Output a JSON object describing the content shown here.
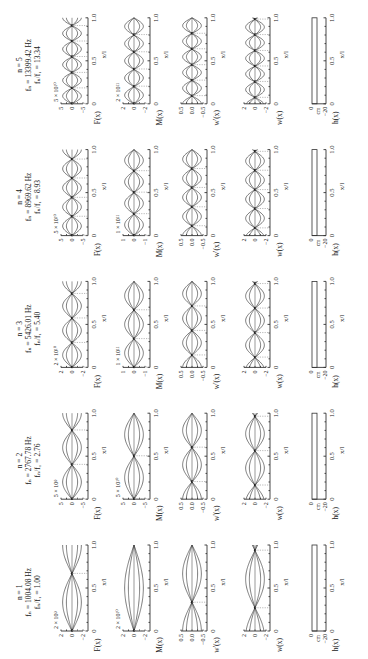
{
  "figure": {
    "rotation_deg": -90,
    "row_labels": [
      "F(x)",
      "M(x)",
      "w'(x)",
      "w(x)",
      "h(x)"
    ],
    "x_axis_label": "x/l",
    "x_ticks": [
      "0",
      "0.5",
      "1.0"
    ],
    "h_unit": "cm",
    "h_ticks": [
      "0",
      "−20"
    ]
  },
  "chart_data": {
    "type": "line",
    "xlabel": "x/l",
    "xlim": [
      0,
      1.0
    ],
    "modes": [
      {
        "n": "n = 1",
        "fn": "fₙ = 1004.08 Hz",
        "ratio": "fₙ/f₁ = 1.00",
        "F": {
          "scale": "2 × 10⁹",
          "ticks": [
            "2",
            "0",
            "−2"
          ]
        },
        "M": {
          "scale": "2 × 10¹⁰",
          "ticks": [
            "2",
            "0",
            "−2"
          ]
        },
        "wp": {
          "ticks": [
            "0.5",
            "0.0",
            "−0.5"
          ]
        },
        "w": {
          "ticks": [
            "2",
            "0",
            "−2"
          ]
        },
        "mode": 1
      },
      {
        "n": "n = 2",
        "fn": "fₙ = 2767.78 Hz",
        "ratio": "fₙ/f₁ = 2.76",
        "F": {
          "scale": "5 × 10⁹",
          "ticks": [
            "5",
            "0",
            "−5"
          ]
        },
        "M": {
          "scale": "5 × 10¹⁰",
          "ticks": [
            "5",
            "0",
            "−5"
          ]
        },
        "wp": {
          "ticks": [
            "0.5",
            "0.0",
            "−0.5"
          ]
        },
        "w": {
          "ticks": [
            "2",
            "0",
            "−2"
          ]
        },
        "mode": 2
      },
      {
        "n": "n = 3",
        "fn": "fₙ = 5426.01 Hz",
        "ratio": "fₙ/f₁ = 5.40",
        "F": {
          "scale": "2 × 10¹⁰",
          "ticks": [
            "2",
            "0",
            "−2"
          ]
        },
        "M": {
          "scale": "1 × 10¹¹",
          "ticks": [
            "1",
            "0",
            "−1"
          ]
        },
        "wp": {
          "ticks": [
            "0.5",
            "0.0",
            "−0.5"
          ]
        },
        "w": {
          "ticks": [
            "2",
            "0",
            "−2"
          ]
        },
        "mode": 3
      },
      {
        "n": "n = 4",
        "fn": "fₙ = 8969.62 Hz",
        "ratio": "fₙ/f₁ = 8.93",
        "F": {
          "scale": "5 × 10¹⁰",
          "ticks": [
            "5",
            "0",
            "−5"
          ]
        },
        "M": {
          "scale": "1 × 10¹¹",
          "ticks": [
            "1",
            "0",
            "−1"
          ]
        },
        "wp": {
          "ticks": [
            "0.5",
            "0.0",
            "−0.5"
          ]
        },
        "w": {
          "ticks": [
            "2",
            "0",
            "−2"
          ]
        },
        "mode": 4
      },
      {
        "n": "n = 5",
        "fn": "fₙ = 13399.42 Hz",
        "ratio": "fₙ/f₁ = 13.34",
        "F": {
          "scale": "5 × 10¹⁰",
          "ticks": [
            "5",
            "0",
            "−5"
          ]
        },
        "M": {
          "scale": "2 × 10¹¹",
          "ticks": [
            "2",
            "0",
            "−2"
          ]
        },
        "wp": {
          "ticks": [
            "0.5",
            "0.0",
            "−0.5"
          ]
        },
        "w": {
          "ticks": [
            "2",
            "0",
            "−2"
          ]
        },
        "mode": 5
      }
    ]
  }
}
